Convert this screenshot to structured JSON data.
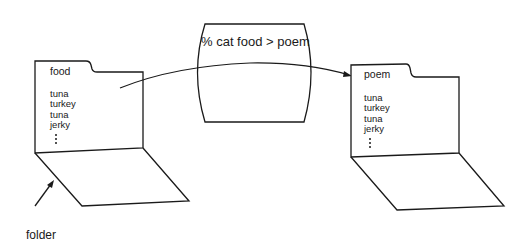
{
  "diagram": {
    "command": "% cat food > poem",
    "source_folder": {
      "name": "food",
      "items": [
        "tuna",
        "turkey",
        "tuna",
        "jerky"
      ],
      "more_indicator": "⋮"
    },
    "target_folder": {
      "name": "poem",
      "items": [
        "tuna",
        "turkey",
        "tuna",
        "jerky"
      ],
      "more_indicator": "⋮"
    },
    "annotation": {
      "label": "folder"
    },
    "colors": {
      "stroke": "#1a1a1a",
      "background": "#ffffff"
    }
  }
}
